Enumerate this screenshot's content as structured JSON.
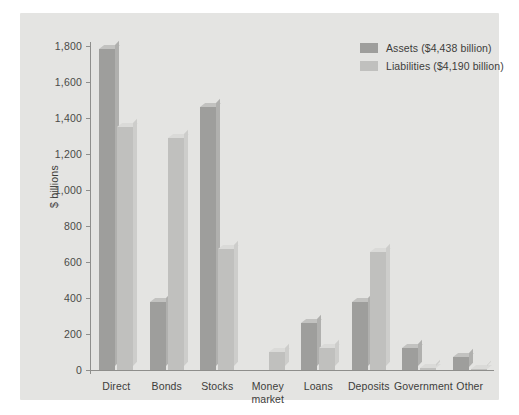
{
  "chart_data": {
    "type": "bar",
    "title": "",
    "xlabel": "",
    "ylabel": "$ billions",
    "ylim": [
      0,
      1800
    ],
    "yticks": [
      "0",
      "200",
      "400",
      "600",
      "800",
      "1,000",
      "1,200",
      "1,400",
      "1,600",
      "1,800"
    ],
    "ytick_values": [
      0,
      200,
      400,
      600,
      800,
      1000,
      1200,
      1400,
      1600,
      1800
    ],
    "grid": false,
    "legend_position": "top-right",
    "categories": [
      "Direct",
      "Bonds",
      "Stocks",
      "Money market",
      "Loans",
      "Deposits",
      "Government",
      "Other"
    ],
    "series": [
      {
        "name": "Assets ($4,438 billion)",
        "color": "#9e9e9c",
        "total": "$4,438 billion",
        "values": [
          1785,
          380,
          1460,
          0,
          260,
          380,
          120,
          75
        ]
      },
      {
        "name": "Liabilities ($4,190 billion)",
        "color": "#c0c0be",
        "total": "$4,190 billion",
        "values": [
          1350,
          1290,
          670,
          100,
          120,
          655,
          10,
          8
        ]
      }
    ]
  },
  "legend": {
    "items": [
      {
        "label": "Assets ($4,438 billion)",
        "swatch": "assets"
      },
      {
        "label": "Liabilities ($4,190 billion)",
        "swatch": "liab"
      }
    ]
  },
  "axis": {
    "y_title": "$ billions"
  },
  "colors": {
    "panel_background": "#e4e4e2",
    "figure_background": "#ffffff",
    "assets_bar": "#9e9e9c",
    "liabilities_bar": "#c0c0be",
    "axis_line": "#8e8e8c",
    "text": "#3d3d3b"
  }
}
